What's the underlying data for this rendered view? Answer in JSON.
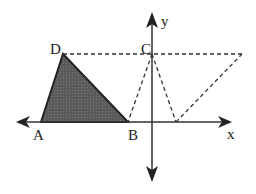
{
  "diagram": {
    "type": "coordinate-plane-triangle-transformation",
    "axes": {
      "x_label": "x",
      "y_label": "y"
    },
    "points": {
      "A": {
        "label": "A",
        "x": 41,
        "y": 122
      },
      "B": {
        "label": "B",
        "x": 128,
        "y": 122
      },
      "C": {
        "label": "C",
        "x": 152,
        "y": 54
      },
      "D": {
        "label": "D",
        "x": 63,
        "y": 54
      },
      "E": {
        "x": 176,
        "y": 122
      },
      "F": {
        "x": 242,
        "y": 54
      }
    },
    "shaded_triangle": [
      "A",
      "D",
      "B"
    ],
    "dashed_segments": [
      [
        "D",
        "F"
      ],
      [
        "C",
        "B"
      ],
      [
        "C",
        "E"
      ],
      [
        "E",
        "F"
      ]
    ],
    "colors": {
      "fill": "#555555",
      "stroke": "#222222",
      "dash": "#333333"
    }
  }
}
